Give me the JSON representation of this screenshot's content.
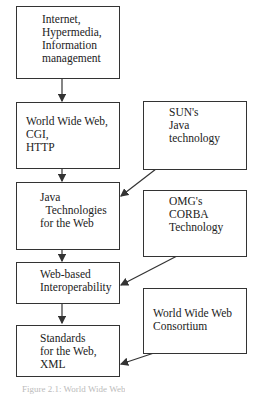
{
  "diagram": {
    "main_flow": [
      {
        "id": "b1",
        "lines": [
          "Internet,",
          "Hypermedia,",
          "Information",
          "management"
        ]
      },
      {
        "id": "b2",
        "lines": [
          "World Wide Web,",
          "CGI,",
          "HTTP"
        ]
      },
      {
        "id": "b3",
        "lines": [
          "Java",
          "  Technologies",
          "for the Web"
        ]
      },
      {
        "id": "b4",
        "lines": [
          "Web-based",
          "Interoperability"
        ]
      },
      {
        "id": "b5",
        "lines": [
          "Standards",
          "for the Web,",
          "XML"
        ]
      }
    ],
    "influences": [
      {
        "id": "s1",
        "lines": [
          "SUN's",
          "Java",
          "technology"
        ],
        "target": "b3"
      },
      {
        "id": "s2",
        "lines": [
          "OMG's",
          "CORBA",
          "Technology"
        ],
        "target": "b4"
      },
      {
        "id": "s3",
        "lines": [
          "World Wide Web",
          "Consortium"
        ],
        "target": "b5"
      }
    ],
    "caption": "Figure 2.1: World Wide Web"
  }
}
